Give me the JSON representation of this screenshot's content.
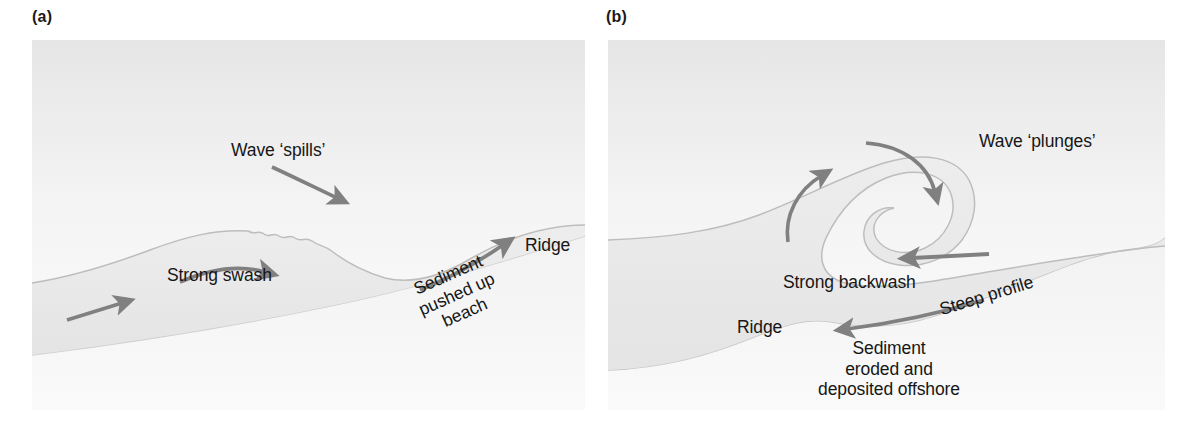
{
  "figure": {
    "type": "diagram",
    "panels": [
      {
        "id": "a",
        "label": "(a)",
        "wave_type": "spilling",
        "annotations": [
          {
            "id": "wave-spills",
            "text": "Wave ‘spills’"
          },
          {
            "id": "strong-swash",
            "text": "Strong swash"
          },
          {
            "id": "ridge",
            "text": "Ridge"
          },
          {
            "id": "sediment-pushed",
            "text": "Sediment\npushed up\nbeach",
            "lines": [
              "Sediment",
              "pushed up",
              "beach"
            ],
            "rotation_deg": -24
          }
        ],
        "arrows": [
          {
            "id": "incoming-wave-arrow",
            "direction": "right"
          },
          {
            "id": "swash-arrow",
            "direction": "right-curved"
          },
          {
            "id": "spill-arrow",
            "direction": "down-right"
          },
          {
            "id": "sediment-up-arrow",
            "direction": "up-right"
          }
        ]
      },
      {
        "id": "b",
        "label": "(b)",
        "wave_type": "plunging",
        "annotations": [
          {
            "id": "wave-plunges",
            "text": "Wave ‘plunges’"
          },
          {
            "id": "strong-backwash",
            "text": "Strong backwash"
          },
          {
            "id": "steep-profile",
            "text": "Steep profile",
            "rotation_deg": -17
          },
          {
            "id": "ridge",
            "text": "Ridge"
          },
          {
            "id": "sediment-eroded",
            "text": "Sediment\neroded and\ndeposited offshore",
            "lines": [
              "Sediment",
              "eroded and",
              "deposited offshore"
            ]
          }
        ],
        "arrows": [
          {
            "id": "plunge-arrow",
            "direction": "down-curved"
          },
          {
            "id": "curl-arrow",
            "direction": "up-curved"
          },
          {
            "id": "backwash-arrow",
            "direction": "left"
          },
          {
            "id": "sediment-offshore-arrow",
            "direction": "left"
          }
        ]
      }
    ],
    "colors": {
      "water_fill": "#ececec",
      "water_outline": "#b5b5b5",
      "arrow": "#808080",
      "text": "#161616",
      "sky_top": "#e8e8e8",
      "sky_bottom": "#fbfbfb",
      "page_background": "#ffffff"
    }
  }
}
